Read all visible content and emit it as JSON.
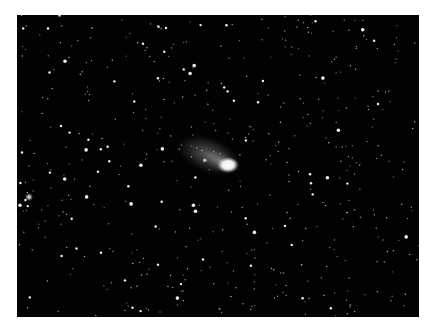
{
  "image": {
    "subject": "comet",
    "alt": "Comet with bright nucleus and faint coma against a dense star field",
    "colors": {
      "background": "#020202",
      "star": "#ffffff",
      "nucleus": "#ffffff",
      "coma": "#9a9a9a",
      "page": "#ffffff"
    },
    "comet": {
      "nucleus_x": 211,
      "nucleus_y": 150,
      "tail_dir_deg": 200
    },
    "bright_star": {
      "x": 12,
      "y": 182
    }
  }
}
